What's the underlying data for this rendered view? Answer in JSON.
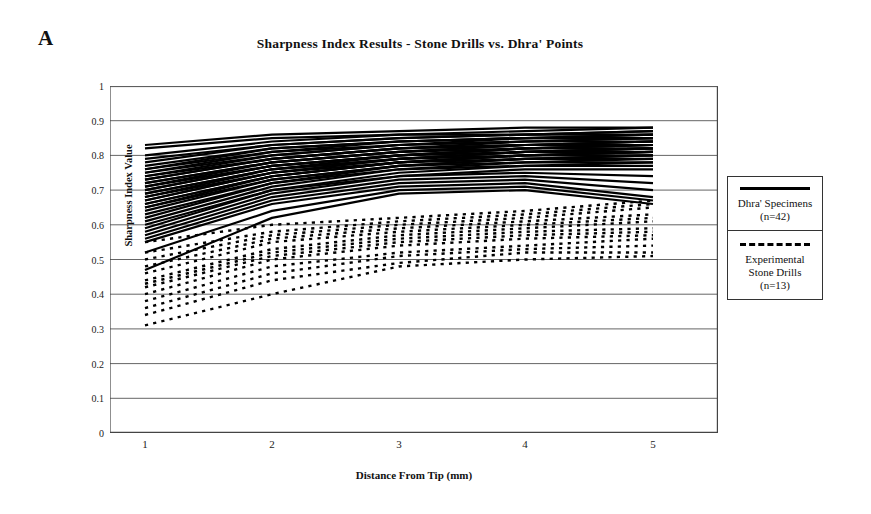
{
  "figure": {
    "panel_label": "A",
    "title": "Sharpness Index Results - Stone Drills vs. Dhra' Points"
  },
  "axes": {
    "y_title": "Sharpness Index Value",
    "x_title": "Distance From Tip (mm)",
    "y_ticks": [
      "1",
      "0.9",
      "0.8",
      "0.7",
      "0.6",
      "0.5",
      "0.4",
      "0.3",
      "0.2",
      "0.1",
      "0"
    ],
    "x_ticks": [
      "1",
      "2",
      "3",
      "4",
      "5"
    ]
  },
  "legend": {
    "position": "right",
    "entries": [
      {
        "style": "solid",
        "swatch_name": "solid-line-swatch",
        "line1": "Dhra' Specimens",
        "line2": "(n=42)"
      },
      {
        "style": "dashed",
        "swatch_name": "dashed-line-swatch",
        "line1": "Experimental",
        "line2": "Stone Drills",
        "line3": "(n=13)"
      }
    ]
  },
  "colors": {
    "line": "#000000",
    "grid": "#555555",
    "axis": "#444444",
    "background": "#ffffff"
  },
  "chart_data": {
    "type": "line",
    "title": "Sharpness Index Results - Stone Drills vs. Dhra' Points",
    "xlabel": "Distance From Tip (mm)",
    "ylabel": "Sharpness Index Value",
    "x": [
      1,
      2,
      3,
      4,
      5
    ],
    "xlim": [
      1,
      5
    ],
    "ylim": [
      0,
      1
    ],
    "ytick_step": 0.1,
    "grid": "horizontal",
    "legend_position": "right",
    "series_groups": [
      {
        "name": "Dhra' Specimens",
        "n": 42,
        "style": "solid",
        "color": "#000000",
        "series": [
          {
            "name": "Dhra-01",
            "values": [
              0.83,
              0.86,
              0.87,
              0.88,
              0.88
            ]
          },
          {
            "name": "Dhra-02",
            "values": [
              0.82,
              0.85,
              0.86,
              0.87,
              0.88
            ]
          },
          {
            "name": "Dhra-03",
            "values": [
              0.8,
              0.84,
              0.86,
              0.86,
              0.87
            ]
          },
          {
            "name": "Dhra-04",
            "values": [
              0.79,
              0.83,
              0.85,
              0.86,
              0.87
            ]
          },
          {
            "name": "Dhra-05",
            "values": [
              0.78,
              0.83,
              0.85,
              0.86,
              0.86
            ]
          },
          {
            "name": "Dhra-06",
            "values": [
              0.77,
              0.82,
              0.84,
              0.85,
              0.86
            ]
          },
          {
            "name": "Dhra-07",
            "values": [
              0.76,
              0.82,
              0.84,
              0.85,
              0.86
            ]
          },
          {
            "name": "Dhra-08",
            "values": [
              0.76,
              0.81,
              0.84,
              0.85,
              0.85
            ]
          },
          {
            "name": "Dhra-09",
            "values": [
              0.75,
              0.81,
              0.83,
              0.85,
              0.85
            ]
          },
          {
            "name": "Dhra-10",
            "values": [
              0.75,
              0.8,
              0.83,
              0.84,
              0.85
            ]
          },
          {
            "name": "Dhra-11",
            "values": [
              0.74,
              0.8,
              0.83,
              0.84,
              0.85
            ]
          },
          {
            "name": "Dhra-12",
            "values": [
              0.74,
              0.79,
              0.82,
              0.84,
              0.84
            ]
          },
          {
            "name": "Dhra-13",
            "values": [
              0.73,
              0.79,
              0.82,
              0.83,
              0.84
            ]
          },
          {
            "name": "Dhra-14",
            "values": [
              0.73,
              0.79,
              0.82,
              0.83,
              0.84
            ]
          },
          {
            "name": "Dhra-15",
            "values": [
              0.72,
              0.78,
              0.81,
              0.83,
              0.84
            ]
          },
          {
            "name": "Dhra-16",
            "values": [
              0.72,
              0.78,
              0.81,
              0.83,
              0.83
            ]
          },
          {
            "name": "Dhra-17",
            "values": [
              0.71,
              0.78,
              0.81,
              0.82,
              0.83
            ]
          },
          {
            "name": "Dhra-18",
            "values": [
              0.71,
              0.77,
              0.8,
              0.82,
              0.83
            ]
          },
          {
            "name": "Dhra-19",
            "values": [
              0.7,
              0.77,
              0.8,
              0.82,
              0.83
            ]
          },
          {
            "name": "Dhra-20",
            "values": [
              0.7,
              0.77,
              0.8,
              0.82,
              0.82
            ]
          },
          {
            "name": "Dhra-21",
            "values": [
              0.69,
              0.76,
              0.8,
              0.81,
              0.82
            ]
          },
          {
            "name": "Dhra-22",
            "values": [
              0.69,
              0.76,
              0.79,
              0.81,
              0.82
            ]
          },
          {
            "name": "Dhra-23",
            "values": [
              0.68,
              0.76,
              0.79,
              0.81,
              0.82
            ]
          },
          {
            "name": "Dhra-24",
            "values": [
              0.68,
              0.75,
              0.79,
              0.81,
              0.81
            ]
          },
          {
            "name": "Dhra-25",
            "values": [
              0.67,
              0.75,
              0.79,
              0.8,
              0.81
            ]
          },
          {
            "name": "Dhra-26",
            "values": [
              0.67,
              0.75,
              0.78,
              0.8,
              0.81
            ]
          },
          {
            "name": "Dhra-27",
            "values": [
              0.66,
              0.74,
              0.78,
              0.8,
              0.81
            ]
          },
          {
            "name": "Dhra-28",
            "values": [
              0.66,
              0.74,
              0.78,
              0.8,
              0.8
            ]
          },
          {
            "name": "Dhra-29",
            "values": [
              0.65,
              0.74,
              0.78,
              0.79,
              0.8
            ]
          },
          {
            "name": "Dhra-30",
            "values": [
              0.65,
              0.73,
              0.77,
              0.79,
              0.8
            ]
          },
          {
            "name": "Dhra-31",
            "values": [
              0.64,
              0.73,
              0.77,
              0.79,
              0.79
            ]
          },
          {
            "name": "Dhra-32",
            "values": [
              0.63,
              0.72,
              0.77,
              0.78,
              0.79
            ]
          },
          {
            "name": "Dhra-33",
            "values": [
              0.62,
              0.72,
              0.76,
              0.78,
              0.78
            ]
          },
          {
            "name": "Dhra-34",
            "values": [
              0.61,
              0.71,
              0.76,
              0.77,
              0.78
            ]
          },
          {
            "name": "Dhra-35",
            "values": [
              0.6,
              0.7,
              0.75,
              0.77,
              0.77
            ]
          },
          {
            "name": "Dhra-36",
            "values": [
              0.59,
              0.7,
              0.74,
              0.76,
              0.76
            ]
          },
          {
            "name": "Dhra-37",
            "values": [
              0.58,
              0.69,
              0.74,
              0.75,
              0.74
            ]
          },
          {
            "name": "Dhra-38",
            "values": [
              0.57,
              0.68,
              0.73,
              0.74,
              0.72
            ]
          },
          {
            "name": "Dhra-39",
            "values": [
              0.56,
              0.67,
              0.72,
              0.73,
              0.7
            ]
          },
          {
            "name": "Dhra-40",
            "values": [
              0.55,
              0.66,
              0.71,
              0.72,
              0.68
            ]
          },
          {
            "name": "Dhra-41",
            "values": [
              0.52,
              0.64,
              0.7,
              0.71,
              0.67
            ]
          },
          {
            "name": "Dhra-42",
            "values": [
              0.47,
              0.62,
              0.69,
              0.7,
              0.66
            ]
          }
        ]
      },
      {
        "name": "Experimental Stone Drills",
        "n": 13,
        "style": "dashed",
        "color": "#000000",
        "series": [
          {
            "name": "Drill-01",
            "values": [
              0.55,
              0.6,
              0.62,
              0.64,
              0.67
            ]
          },
          {
            "name": "Drill-02",
            "values": [
              0.52,
              0.58,
              0.61,
              0.63,
              0.66
            ]
          },
          {
            "name": "Drill-03",
            "values": [
              0.5,
              0.57,
              0.6,
              0.62,
              0.65
            ]
          },
          {
            "name": "Drill-04",
            "values": [
              0.48,
              0.56,
              0.59,
              0.61,
              0.63
            ]
          },
          {
            "name": "Drill-05",
            "values": [
              0.46,
              0.55,
              0.58,
              0.6,
              0.62
            ]
          },
          {
            "name": "Drill-06",
            "values": [
              0.44,
              0.53,
              0.57,
              0.59,
              0.61
            ]
          },
          {
            "name": "Drill-07",
            "values": [
              0.43,
              0.52,
              0.56,
              0.58,
              0.59
            ]
          },
          {
            "name": "Drill-08",
            "values": [
              0.42,
              0.51,
              0.55,
              0.57,
              0.58
            ]
          },
          {
            "name": "Drill-09",
            "values": [
              0.4,
              0.5,
              0.54,
              0.56,
              0.57
            ]
          },
          {
            "name": "Drill-10",
            "values": [
              0.38,
              0.48,
              0.52,
              0.54,
              0.56
            ]
          },
          {
            "name": "Drill-11",
            "values": [
              0.36,
              0.46,
              0.51,
              0.53,
              0.54
            ]
          },
          {
            "name": "Drill-12",
            "values": [
              0.34,
              0.44,
              0.49,
              0.52,
              0.52
            ]
          },
          {
            "name": "Drill-13",
            "values": [
              0.31,
              0.4,
              0.48,
              0.5,
              0.51
            ]
          }
        ]
      }
    ]
  }
}
